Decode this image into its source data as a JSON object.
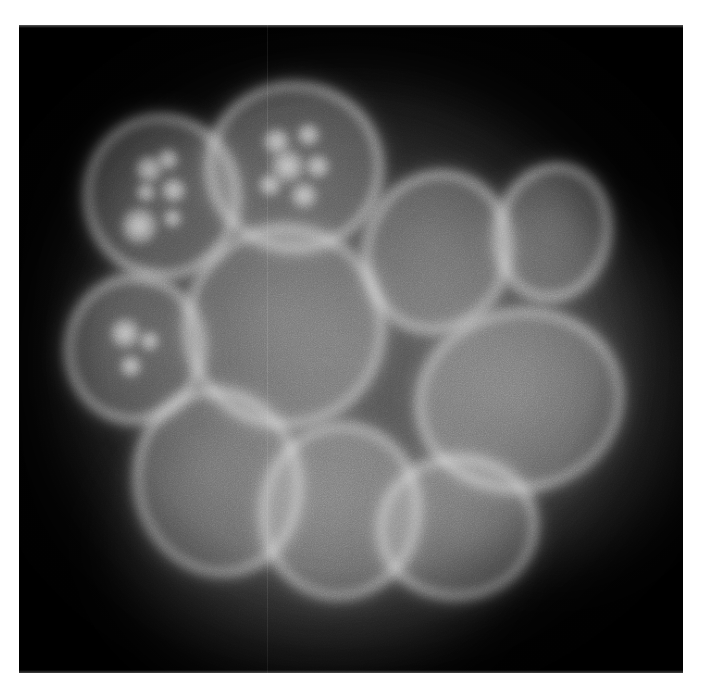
{
  "page": {
    "background_color": "#ffffff",
    "width": 703,
    "height": 688,
    "title": "Fluorescence micrograph of a cell nucleus cluster"
  },
  "micrograph": {
    "name": "fluorescence-micrograph",
    "modality": "grayscale fluorescence microscopy",
    "subject": "cluster of cell nuclei with labelled nuclear envelope",
    "frame": {
      "x": 19,
      "y": 25,
      "width": 664,
      "height": 648
    },
    "colors": {
      "background": "#000000",
      "nuclear_interior": "#3e3e3e",
      "nuclear_envelope": "#a8a8a8",
      "nucleolus_highlight": "#bebebe",
      "cytoplasm_haze": "#2a2a2a",
      "page_border": "#ffffff"
    },
    "artifacts": [
      {
        "name": "vertical-scanline",
        "x_percent": 37.4,
        "opacity": 0.085
      }
    ],
    "diffuse_mass": [
      {
        "name": "cytoplasm-haze-main",
        "cx": 49,
        "cy": 52,
        "rx": 44,
        "ry": 44,
        "level": "#3a3a3a"
      },
      {
        "name": "cytoplasm-haze-lower",
        "cx": 44,
        "cy": 80,
        "rx": 30,
        "ry": 22,
        "level": "#2e2e2e"
      },
      {
        "name": "cytoplasm-haze-right",
        "cx": 80,
        "cy": 56,
        "rx": 24,
        "ry": 28,
        "level": "#303030"
      }
    ],
    "nuclei": [
      {
        "name": "nucleus-upper-left",
        "cx": 21.5,
        "cy": 26.5,
        "rx": 11.6,
        "ry": 12.6,
        "rot": -8,
        "speckles": [
          {
            "cx": 44,
            "cy": 32,
            "r": 9
          },
          {
            "cx": 57,
            "cy": 28,
            "r": 7
          },
          {
            "cx": 40,
            "cy": 46,
            "r": 6
          },
          {
            "cx": 58,
            "cy": 47,
            "r": 8
          },
          {
            "cx": 33,
            "cy": 66,
            "r": 12
          },
          {
            "cx": 55,
            "cy": 64,
            "r": 6
          }
        ]
      },
      {
        "name": "nucleus-top-centre",
        "cx": 41.5,
        "cy": 22.0,
        "rx": 13.2,
        "ry": 13.0,
        "rot": 6,
        "speckles": [
          {
            "cx": 38,
            "cy": 36,
            "r": 8
          },
          {
            "cx": 56,
            "cy": 30,
            "r": 7
          },
          {
            "cx": 46,
            "cy": 50,
            "r": 10
          },
          {
            "cx": 63,
            "cy": 48,
            "r": 7
          },
          {
            "cx": 37,
            "cy": 62,
            "r": 7
          },
          {
            "cx": 57,
            "cy": 66,
            "r": 8
          }
        ]
      },
      {
        "name": "nucleus-mid-left-small",
        "cx": 17.5,
        "cy": 50.0,
        "rx": 10.4,
        "ry": 11.4,
        "rot": 4,
        "speckles": [
          {
            "cx": 42,
            "cy": 40,
            "r": 11
          },
          {
            "cx": 60,
            "cy": 44,
            "r": 7
          },
          {
            "cx": 48,
            "cy": 62,
            "r": 8
          }
        ]
      },
      {
        "name": "nucleus-centre-large",
        "cx": 40.0,
        "cy": 46.5,
        "rx": 15.0,
        "ry": 15.5,
        "rot": -4,
        "speckles": []
      },
      {
        "name": "nucleus-upper-right",
        "cx": 63.0,
        "cy": 35.0,
        "rx": 11.0,
        "ry": 12.5,
        "rot": 18,
        "speckles": []
      },
      {
        "name": "nucleus-far-right-top",
        "cx": 80.5,
        "cy": 32.0,
        "rx": 8.6,
        "ry": 10.6,
        "rot": 12,
        "speckles": []
      },
      {
        "name": "nucleus-right-large",
        "cx": 75.5,
        "cy": 58.0,
        "rx": 15.5,
        "ry": 14.0,
        "rot": -10,
        "speckles": []
      },
      {
        "name": "nucleus-lower-left",
        "cx": 30.0,
        "cy": 70.5,
        "rx": 12.5,
        "ry": 14.5,
        "rot": -12,
        "speckles": []
      },
      {
        "name": "nucleus-lower-centre",
        "cx": 48.5,
        "cy": 75.0,
        "rx": 12.0,
        "ry": 13.5,
        "rot": 8,
        "speckles": []
      },
      {
        "name": "nucleus-lower-right",
        "cx": 66.0,
        "cy": 77.5,
        "rx": 12.0,
        "ry": 11.0,
        "rot": -6,
        "speckles": []
      }
    ]
  }
}
